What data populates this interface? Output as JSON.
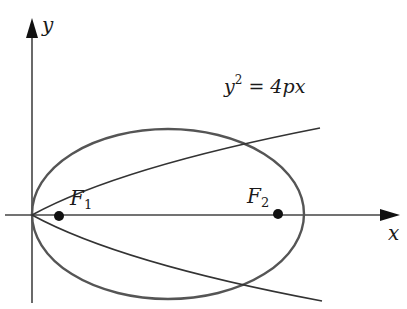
{
  "figure": {
    "axes": {
      "x_label": "x",
      "y_label": "y"
    },
    "curves": {
      "ellipse": {
        "label": "",
        "color": "#555555"
      },
      "parabola": {
        "label_base": "y",
        "label_exp": "2",
        "label_rest": " = 4px",
        "color": "#333333"
      }
    },
    "points": [
      {
        "name": "F",
        "subscript": "1"
      },
      {
        "name": "F",
        "subscript": "2"
      }
    ],
    "colors": {
      "axis": "#444444",
      "point": "#111111",
      "text": "#1a1a1a"
    }
  }
}
